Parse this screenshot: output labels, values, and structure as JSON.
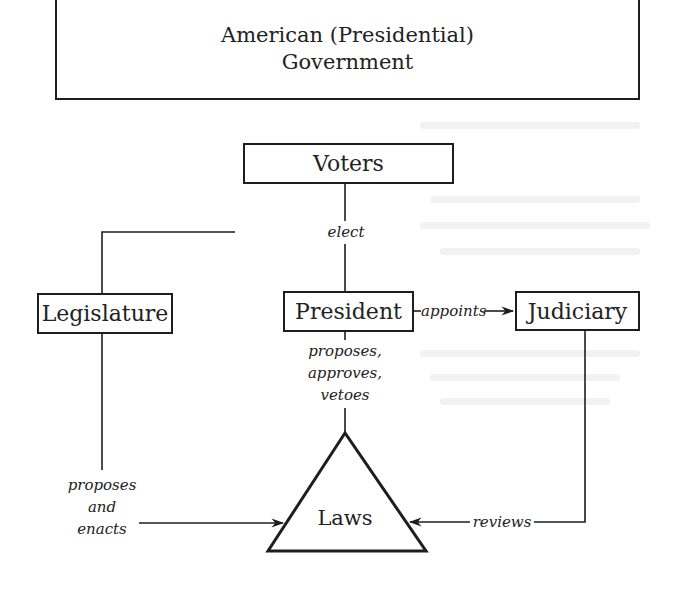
{
  "diagram": {
    "title_line1": "American (Presidential)",
    "title_line2": "Government",
    "nodes": {
      "voters": "Voters",
      "legislature": "Legislature",
      "president": "President",
      "judiciary": "Judiciary",
      "laws": "Laws"
    },
    "edges": {
      "elect": "elect",
      "appoints": "appoints",
      "president_to_laws_1": "proposes,",
      "president_to_laws_2": "approves,",
      "president_to_laws_3": "vetoes",
      "legislature_to_laws_1": "proposes",
      "legislature_to_laws_2": "and",
      "legislature_to_laws_3": "enacts",
      "reviews": "reviews"
    },
    "colors": {
      "ink": "#1e1e1e",
      "paper": "#ffffff"
    }
  }
}
